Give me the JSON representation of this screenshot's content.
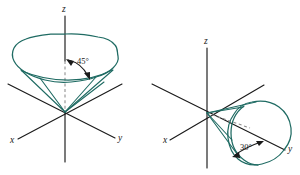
{
  "figure": {
    "background_color": "#ffffff",
    "axis_color": "#1a1a1a",
    "curve_color": "#1f6b63",
    "dashed_color": "#8c8c8c"
  },
  "panels": [
    {
      "id": "left",
      "name": "cone-45-degrees",
      "origin": {
        "x": 65,
        "y": 112
      },
      "axes": [
        {
          "name": "z",
          "label": "z",
          "label_x": 62,
          "label_y": 12
        },
        {
          "name": "x",
          "label": "x",
          "label_x": 10,
          "label_y": 143
        },
        {
          "name": "y",
          "label": "y",
          "label_x": 118,
          "label_y": 141
        }
      ],
      "angle": {
        "value": "45°",
        "label_x": 77,
        "label_y": 64
      }
    },
    {
      "id": "right",
      "name": "cone-30-degrees",
      "origin": {
        "x": 207,
        "y": 113
      },
      "axes": [
        {
          "name": "z",
          "label": "z",
          "label_x": 204,
          "label_y": 44
        },
        {
          "name": "x",
          "label": "x",
          "label_x": 163,
          "label_y": 143
        },
        {
          "name": "y",
          "label": "y",
          "label_x": 288,
          "label_y": 152
        }
      ],
      "angle": {
        "value": "30°",
        "label_x": 244,
        "label_y": 147
      }
    }
  ]
}
